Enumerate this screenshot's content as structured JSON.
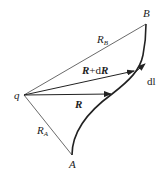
{
  "diagram": {
    "charge_label": "q",
    "point_a_label": "A",
    "point_b_label": "B",
    "ra_label": {
      "main": "R",
      "sub": "A"
    },
    "rb_label": {
      "main": "R",
      "sub": "B"
    },
    "r_vector_label": "R",
    "r_plus_dr_label": {
      "r": "R",
      "plus": "+d",
      "dr": "R"
    },
    "dl_label": "dl"
  },
  "colors": {
    "line": "#333333",
    "curve": "#222222"
  }
}
